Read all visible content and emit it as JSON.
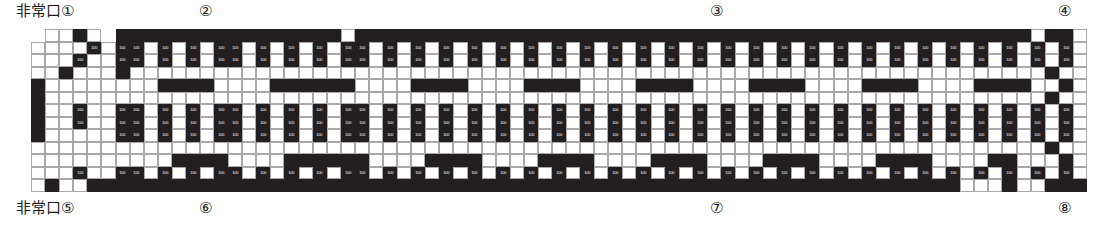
{
  "document": {
    "type": "floor-plan",
    "title": "",
    "orientation": "horizontal-strip"
  },
  "labels": {
    "top_left": {
      "text": "非常口①",
      "name": "emergency-exit-1"
    },
    "top_2": {
      "text": "②",
      "name": "emergency-exit-2"
    },
    "top_3": {
      "text": "③",
      "name": "emergency-exit-3"
    },
    "top_4": {
      "text": "④",
      "name": "emergency-exit-4"
    },
    "bottom_left": {
      "text": "非常口⑤",
      "name": "emergency-exit-5"
    },
    "bottom_6": {
      "text": "⑥",
      "name": "emergency-exit-6"
    },
    "bottom_7": {
      "text": "⑦",
      "name": "emergency-exit-7"
    },
    "bottom_8": {
      "text": "⑧",
      "name": "emergency-exit-8"
    }
  },
  "colors": {
    "block_fill": "#231f20",
    "open_fill": "#ffffff",
    "tone_fill": "#f2f2f2",
    "grid_line": "#a8a8a8",
    "ink": "#1a1a1a"
  },
  "grid": {
    "cols": 76,
    "rows": 13,
    "cell_w": 14.08,
    "cell_h": 12.5,
    "dimension_label": "100",
    "legend": {
      "w": "open cell",
      "l": "toned cell",
      "d": "solid block"
    },
    "rows_data": [
      "nnwwdwnddddddddddddddddwddddddddddddddddddddddddddddddddddddddddddddddddwdd",
      "nwwwwdwddwdwdwddwdwdwdwddwdwdwdwdwdwdwdwdwdwdwdwdwdwdwdwdwdwdwdwdwdwdwdwdwd",
      "nwwwdwwddwdwdwddwdwdwdwddwdwdwdwdwdwdwdwdwdwdwdwdwdwdwdwdwdwdwdwdwdwdwdwdwd",
      "nwwdwwwdwwwwwwwwwwwwwwwwwwwwwwwwwwwwwwwwwwwwwwwwwwwwwwwwwwwwwwwwwwwwwwwwwd",
      "ndwwwwwwwwddddwwwwddddddwwwwddddwwwwddddwwwwddddwwwwddddwwwwddddwwwwddddwwd",
      "ndwwwwwwwwwwwwwwwwwwwwwwwwwwwwwwwwwwwwwwwwwwwwwwwwwwwwwwwwwwwwwwwwwwwwwwwd",
      "ndwwdwwddwdwdwddwdwdwdwddwdwdwdwdwdwdwdwdwdwdwdwdwdwdwdwdwdwdwdwdwdwdwdwdwd",
      "ndwwdwwddwdwdwddwdwdwdwddwdwdwdwdwdwdwdwdwdwdwdwdwdwdwdwdwdwdwdwdwdwdwdwdwd",
      "ndwwwwwddwdwdwddwdwdwdwddwdwdwdwdwdwdwdwdwdwdwdwdwdwdwdwdwdwdwdwdwdwdwdwdwd",
      "nwwwwwwwwwwwwwwwwwwwwwwwwwwwwwwwwwwwwwwwwwwwwwwwwwwwwwwwwwwwwwwwwwwwwwwwwd",
      "nwwwwwwwwwwddddwwwwddddddwwwwddddwwwwddddwwwwddddwwwwddddwwwwddddwwwwddwwwd",
      "nwwwdwwddwdwdwddwdwdwdwddwdwdwdwdwdwdwdwdwdwdwdwdwdwdwdwdwdwdwdwdwdwdwdwdwd",
      "nwdwwddddddddddddddddddddddddddddddddddddddddddddddddddddddddddddddwwwdwwddd"
    ]
  }
}
